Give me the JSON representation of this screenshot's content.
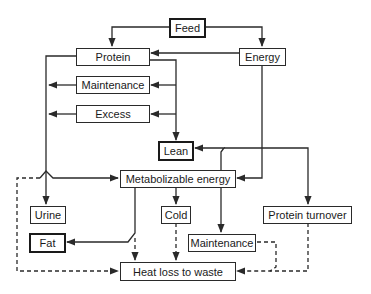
{
  "diagram": {
    "nodes": {
      "feed": "Feed",
      "protein": "Protein",
      "energy": "Energy",
      "maintenance_protein": "Maintenance",
      "excess": "Excess",
      "lean": "Lean",
      "metabolizable_energy": "Metabolizable energy",
      "urine": "Urine",
      "cold": "Cold",
      "protein_turnover": "Protein turnover",
      "fat": "Fat",
      "maintenance_energy": "Maintenance",
      "heat_loss": "Heat loss to waste"
    },
    "edges": [
      {
        "from": "Feed",
        "to": "Protein",
        "style": "solid"
      },
      {
        "from": "Feed",
        "to": "Energy",
        "style": "solid"
      },
      {
        "from": "Energy",
        "to": "Protein",
        "style": "solid"
      },
      {
        "from": "Energy",
        "to": "Metabolizable energy",
        "style": "solid"
      },
      {
        "from": "Protein",
        "to": "Maintenance",
        "style": "solid"
      },
      {
        "from": "Protein",
        "to": "Excess",
        "style": "solid"
      },
      {
        "from": "Protein",
        "to": "Lean",
        "style": "solid"
      },
      {
        "from": "Protein",
        "to": "Urine",
        "style": "solid"
      },
      {
        "from": "Maintenance",
        "to": "(out left)",
        "style": "solid"
      },
      {
        "from": "Excess",
        "to": "(out left)",
        "style": "solid"
      },
      {
        "from": "Metabolizable energy",
        "to": "Lean",
        "style": "solid"
      },
      {
        "from": "Metabolizable energy",
        "to": "Protein turnover",
        "style": "solid"
      },
      {
        "from": "Metabolizable energy",
        "to": "Cold",
        "style": "solid"
      },
      {
        "from": "Metabolizable energy",
        "to": "Maintenance",
        "style": "solid"
      },
      {
        "from": "Metabolizable energy",
        "to": "Fat",
        "style": "solid"
      },
      {
        "from": "Metabolizable energy",
        "to": "Heat loss to waste",
        "style": "dashed"
      },
      {
        "from": "Cold",
        "to": "Heat loss to waste",
        "style": "dashed"
      },
      {
        "from": "Maintenance",
        "to": "Heat loss to waste",
        "style": "dashed"
      },
      {
        "from": "Protein turnover",
        "to": "Heat loss to waste",
        "style": "dashed"
      },
      {
        "from": "Left loop",
        "to": "Heat loss to waste",
        "style": "dashed"
      }
    ]
  }
}
